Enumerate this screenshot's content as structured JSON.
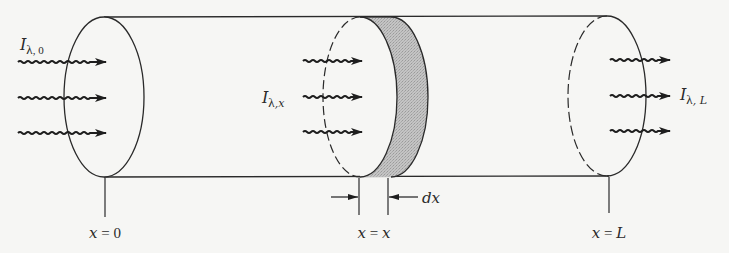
{
  "figure": {
    "colors": {
      "background": "#f6f6f4",
      "line": "#2a2a2a",
      "slab_fill": "#b9b9b9"
    }
  },
  "cylinder": {
    "top_y": 17,
    "bottom_y": 177,
    "left_face": {
      "cx": 104,
      "cy": 97,
      "rx": 40,
      "ry": 80
    },
    "middle_face": {
      "cx": 360,
      "cy": 97,
      "rx": 37,
      "ry": 80
    },
    "slab_back_face": {
      "cx": 391,
      "cy": 97,
      "rx": 37,
      "ry": 80
    },
    "right_face": {
      "cx": 607,
      "cy": 97,
      "rx": 39,
      "ry": 80
    }
  },
  "intensity_labels": {
    "incident": {
      "symbol": "I",
      "sub_lambda": "λ",
      "sub_index": ", 0"
    },
    "local": {
      "symbol": "I",
      "sub_lambda": "λ",
      "sub_index": ",x"
    },
    "exit": {
      "symbol": "I",
      "sub_lambda": "λ",
      "sub_index": ", L"
    }
  },
  "positions": {
    "start": {
      "var": "x",
      "eq": " = ",
      "val": "0"
    },
    "middle": {
      "var": "x",
      "eq": " = ",
      "val": "x"
    },
    "end": {
      "var": "x",
      "eq": " = ",
      "val": "L"
    }
  },
  "slab_width_label": "dx",
  "arrows": {
    "rows_y": [
      62,
      97,
      132
    ],
    "left_group": {
      "x1": 18,
      "x2": 106
    },
    "middle_group": {
      "x1": 303,
      "x2": 362
    },
    "right_group": {
      "x1": 610,
      "x2": 670
    }
  }
}
